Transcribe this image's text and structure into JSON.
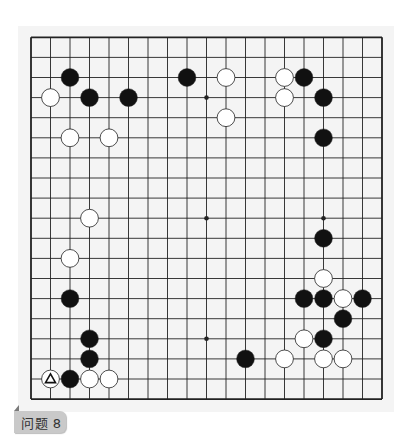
{
  "problem": {
    "label": "问题 8"
  },
  "board": {
    "size": 19,
    "origin_x": 31,
    "origin_y": 37.3,
    "spacing_x": 19.5,
    "spacing_y": 20.1,
    "line_color": "#222222",
    "background": "#f4f4f4",
    "star_points": [
      [
        9,
        3
      ],
      [
        9,
        9
      ],
      [
        15,
        9
      ],
      [
        9,
        15
      ]
    ],
    "stones": [
      {
        "col": 2,
        "row": 2,
        "color": "black"
      },
      {
        "col": 8,
        "row": 2,
        "color": "black"
      },
      {
        "col": 10,
        "row": 2,
        "color": "white"
      },
      {
        "col": 13,
        "row": 2,
        "color": "white"
      },
      {
        "col": 14,
        "row": 2,
        "color": "black"
      },
      {
        "col": 1,
        "row": 3,
        "color": "white"
      },
      {
        "col": 3,
        "row": 3,
        "color": "black"
      },
      {
        "col": 5,
        "row": 3,
        "color": "black"
      },
      {
        "col": 13,
        "row": 3,
        "color": "white"
      },
      {
        "col": 15,
        "row": 3,
        "color": "black"
      },
      {
        "col": 10,
        "row": 4,
        "color": "white"
      },
      {
        "col": 2,
        "row": 5,
        "color": "white"
      },
      {
        "col": 4,
        "row": 5,
        "color": "white"
      },
      {
        "col": 15,
        "row": 5,
        "color": "black"
      },
      {
        "col": 3,
        "row": 9,
        "color": "white"
      },
      {
        "col": 15,
        "row": 10,
        "color": "black"
      },
      {
        "col": 2,
        "row": 11,
        "color": "white"
      },
      {
        "col": 15,
        "row": 12,
        "color": "white"
      },
      {
        "col": 2,
        "row": 13,
        "color": "black"
      },
      {
        "col": 14,
        "row": 13,
        "color": "black"
      },
      {
        "col": 15,
        "row": 13,
        "color": "black"
      },
      {
        "col": 16,
        "row": 13,
        "color": "white"
      },
      {
        "col": 17,
        "row": 13,
        "color": "black"
      },
      {
        "col": 16,
        "row": 14,
        "color": "black"
      },
      {
        "col": 3,
        "row": 15,
        "color": "black"
      },
      {
        "col": 14,
        "row": 15,
        "color": "white"
      },
      {
        "col": 15,
        "row": 15,
        "color": "black"
      },
      {
        "col": 3,
        "row": 16,
        "color": "black"
      },
      {
        "col": 11,
        "row": 16,
        "color": "black"
      },
      {
        "col": 13,
        "row": 16,
        "color": "white"
      },
      {
        "col": 15,
        "row": 16,
        "color": "white"
      },
      {
        "col": 16,
        "row": 16,
        "color": "white"
      },
      {
        "col": 1,
        "row": 17,
        "color": "white",
        "mark": "triangle"
      },
      {
        "col": 2,
        "row": 17,
        "color": "black"
      },
      {
        "col": 3,
        "row": 17,
        "color": "white"
      },
      {
        "col": 4,
        "row": 17,
        "color": "white"
      }
    ]
  },
  "icons": {
    "triangle_mark": "triangle-icon",
    "label_notch": "corner-notch-icon"
  },
  "colors": {
    "black_stone": "#111111",
    "white_stone": "#ffffff",
    "stone_outline": "#222222",
    "label_bg": "#c9c9c9",
    "label_text": "#333333"
  }
}
